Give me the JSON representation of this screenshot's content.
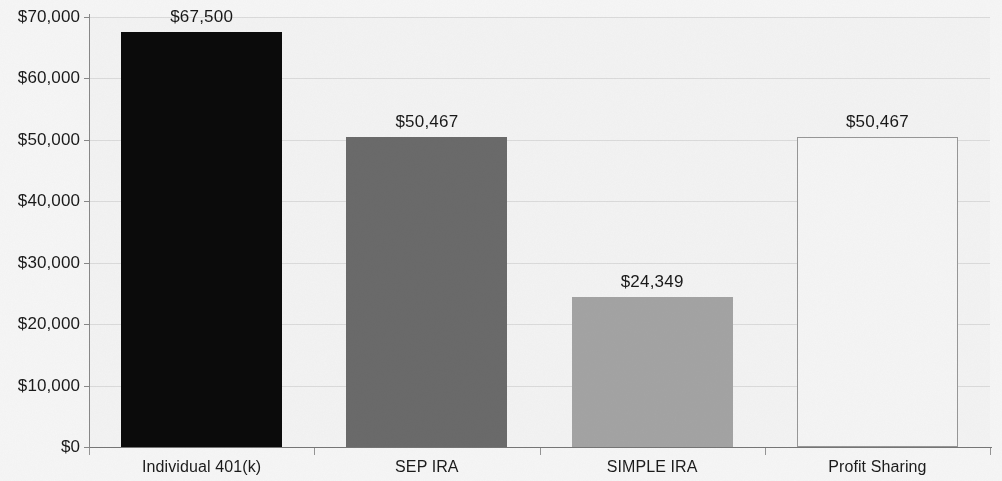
{
  "chart_data": {
    "type": "bar",
    "title": "",
    "subtitle": "",
    "xlabel": "",
    "ylabel": "",
    "categories": [
      "Individual 401(k)",
      "SEP IRA",
      "SIMPLE IRA",
      "Profit Sharing"
    ],
    "values": [
      67500,
      50467,
      24349,
      50467
    ],
    "data_labels": [
      "$67,500",
      "$50,467",
      "$24,349",
      "$50,467"
    ],
    "bar_colors": [
      "#0b0b0b",
      "#6e6e6e",
      "#a9a9a9",
      "#fdfdfd"
    ],
    "bar_border_colors": [
      "#0b0b0b",
      "#6e6e6e",
      "#a9a9a9",
      "#9c9c9c"
    ],
    "ylim": [
      0,
      70000
    ],
    "ytick_values": [
      0,
      10000,
      20000,
      30000,
      40000,
      50000,
      60000,
      70000
    ],
    "ytick_labels": [
      "$0",
      "$10,000",
      "$20,000",
      "$30,000",
      "$40,000",
      "$50,000",
      "$60,000",
      "$70,000"
    ],
    "grid": true,
    "grid_axis": "y",
    "legend": false,
    "legend_position": "none",
    "annotations": []
  },
  "axes": {
    "y_axis_name": "currency-axis",
    "x_axis_name": "plan-type-axis"
  }
}
